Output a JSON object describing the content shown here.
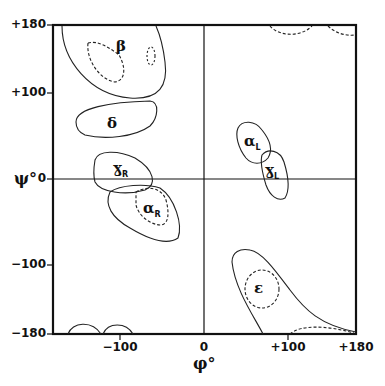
{
  "axes": {
    "x_title": "φ°",
    "y_title": "ψ°",
    "x_ticks": [
      {
        "label": "−180",
        "value": -180
      },
      {
        "label": "−100",
        "value": -100
      },
      {
        "label": "0",
        "value": 0
      },
      {
        "label": "+100",
        "value": 100
      },
      {
        "label": "+180",
        "value": 180
      }
    ],
    "y_ticks": [
      {
        "label": "+180",
        "value": 180
      },
      {
        "label": "+100",
        "value": 100
      },
      {
        "label": "0",
        "value": 0
      },
      {
        "label": "−100",
        "value": -100
      },
      {
        "label": "−180",
        "value": -180
      }
    ],
    "xlim": [
      -180,
      180
    ],
    "ylim": [
      -180,
      180
    ]
  },
  "regions": [
    {
      "name": "β",
      "sub": "",
      "phi": -120,
      "psi": 130
    },
    {
      "name": "δ",
      "sub": "",
      "phi": -130,
      "psi": 65
    },
    {
      "name": "γ",
      "sub": "R",
      "phi": -110,
      "psi": 10
    },
    {
      "name": "α",
      "sub": "R",
      "phi": -60,
      "psi": -40
    },
    {
      "name": "α",
      "sub": "L",
      "phi": 55,
      "psi": 35
    },
    {
      "name": "γ",
      "sub": "L",
      "phi": 80,
      "psi": 10
    },
    {
      "name": "ε",
      "sub": "",
      "phi": 70,
      "psi": -130
    }
  ],
  "labels": {
    "beta": "β",
    "delta": "δ",
    "gammaR": "ɣ",
    "gammaR_sub": "R",
    "alphaR": "α",
    "alphaR_sub": "R",
    "alphaL": "α",
    "alphaL_sub": "L",
    "gammaL": "ɣ",
    "gammaL_sub": "L",
    "epsilon": "ε"
  },
  "tick_labels": {
    "y180": "+180",
    "y100": "+100",
    "y0": "0",
    "ym100": "−100",
    "ym180": "−180",
    "xm100": "−100",
    "x0": "0",
    "x100": "+100",
    "x180": "+180"
  }
}
